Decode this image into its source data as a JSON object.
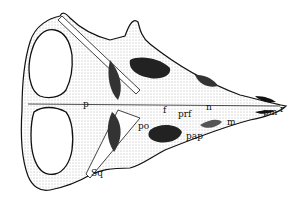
{
  "figure": {
    "labels": [
      {
        "id": "p",
        "text": "p",
        "x": 83,
        "y": 107
      },
      {
        "id": "po",
        "text": "po",
        "x": 138,
        "y": 129
      },
      {
        "id": "f",
        "text": "f",
        "x": 163,
        "y": 113
      },
      {
        "id": "prf",
        "text": "prf",
        "x": 178,
        "y": 117
      },
      {
        "id": "n",
        "text": "n",
        "x": 206,
        "y": 110
      },
      {
        "id": "m",
        "text": "m",
        "x": 227,
        "y": 125
      },
      {
        "id": "pm",
        "text": "pm",
        "x": 263,
        "y": 115
      },
      {
        "id": "r",
        "text": "r",
        "x": 280,
        "y": 112
      },
      {
        "id": "pap",
        "text": "pap",
        "x": 186,
        "y": 139
      },
      {
        "id": "sq",
        "text": "Sq",
        "x": 91,
        "y": 176
      }
    ]
  }
}
